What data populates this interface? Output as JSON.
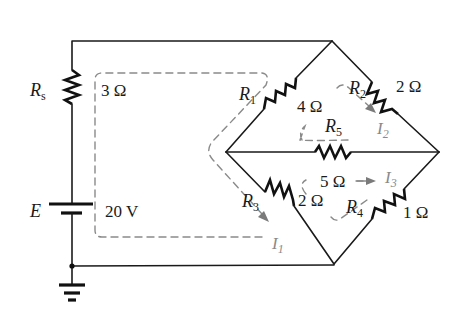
{
  "diagram": {
    "type": "bridge-network-circuit",
    "colors": {
      "wire": "#1a1a1a",
      "resistor": "#111111",
      "loop_current": "#8a8a8a",
      "background": "#ffffff"
    },
    "source": {
      "symbol": "E",
      "value": "20 V"
    },
    "series_resistor": {
      "symbol": "R",
      "subscript": "s",
      "value": "3 Ω"
    },
    "resistors": [
      {
        "symbol": "R",
        "subscript": "1",
        "value": "4 Ω"
      },
      {
        "symbol": "R",
        "subscript": "2",
        "value": "2 Ω"
      },
      {
        "symbol": "R",
        "subscript": "3",
        "value": "2 Ω"
      },
      {
        "symbol": "R",
        "subscript": "4",
        "value": "1 Ω"
      },
      {
        "symbol": "R",
        "subscript": "5",
        "value": "5 Ω"
      }
    ],
    "loop_currents": [
      {
        "symbol": "I",
        "subscript": "1"
      },
      {
        "symbol": "I",
        "subscript": "2"
      },
      {
        "symbol": "I",
        "subscript": "3"
      }
    ],
    "ground": "ground-symbol"
  }
}
